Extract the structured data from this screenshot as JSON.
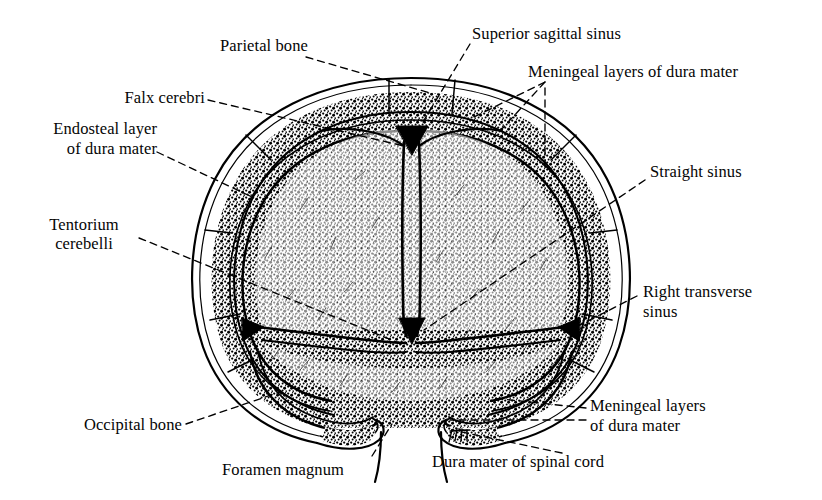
{
  "figure": {
    "type": "anatomical-illustration",
    "style": "black and white line engraving",
    "colors": {
      "ink": "#000000",
      "background": "#ffffff"
    }
  },
  "labels": [
    {
      "id": "parietal-bone",
      "text": "Parietal bone"
    },
    {
      "id": "falx-cerebri",
      "text": "Falx cerebri"
    },
    {
      "id": "endosteal-layer",
      "line1": "Endosteal layer",
      "line2": "of dura mater"
    },
    {
      "id": "tentorium-cerebelli",
      "line1": "Tentorium",
      "line2": "cerebelli"
    },
    {
      "id": "occipital-bone",
      "text": "Occipital bone"
    },
    {
      "id": "foramen-magnum",
      "text": "Foramen magnum"
    },
    {
      "id": "superior-sagittal-sinus",
      "text": "Superior sagittal sinus"
    },
    {
      "id": "meningeal-layers-top",
      "text": "Meningeal layers of dura mater"
    },
    {
      "id": "straight-sinus",
      "text": "Straight sinus"
    },
    {
      "id": "right-transverse-sinus",
      "line1": "Right transverse",
      "line2": "sinus"
    },
    {
      "id": "meningeal-layers-bottom",
      "line1": "Meningeal layers",
      "line2": "of dura mater"
    },
    {
      "id": "dura-mater-spinal-cord",
      "text": "Dura mater of spinal cord"
    }
  ],
  "structures": [
    "skull outer table",
    "diploe",
    "skull inner table",
    "endosteal layer of dura mater",
    "meningeal layer of dura mater",
    "falx cerebri",
    "tentorium cerebelli",
    "superior sagittal sinus",
    "straight sinus",
    "right transverse sinus",
    "left transverse sinus",
    "foramen magnum",
    "dura mater of spinal cord"
  ]
}
